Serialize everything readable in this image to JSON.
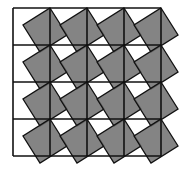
{
  "diagram": {
    "type": "tiling",
    "grid": {
      "rows": 4,
      "cols": 4,
      "origin": [
        13,
        8
      ],
      "cell": 37
    },
    "tilted_square": {
      "offsets": [
        [
          37,
          0
        ],
        [
          54,
          27
        ],
        [
          27,
          44
        ],
        [
          10,
          17
        ]
      ]
    },
    "colors": {
      "background": "#ffffff",
      "tilted_fill": "#6e6e6e",
      "overlap_fill": "#555555",
      "stroke": "#111111"
    }
  }
}
